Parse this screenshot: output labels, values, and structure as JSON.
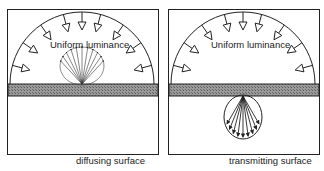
{
  "panels": [
    {
      "id": "diffusing",
      "caption": "diffusing surface",
      "inner_label": "Uniform luminance",
      "distribution": "reflected-above-surface"
    },
    {
      "id": "transmitting",
      "caption": "transmitting surface",
      "inner_label": "Uniform luminance",
      "distribution": "transmitted-below-surface"
    }
  ],
  "colors": {
    "line": "#222222",
    "surface_fill": "#8a8a8a",
    "background": "#ffffff"
  }
}
